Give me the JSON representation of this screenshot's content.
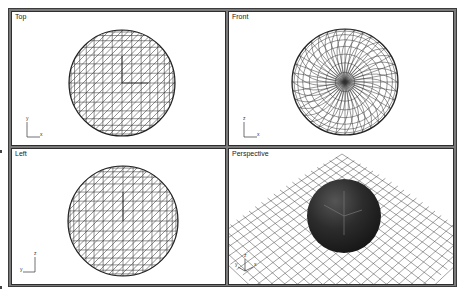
{
  "viewports": [
    {
      "id": "top",
      "label": "Top",
      "axis": {
        "vertical": "y",
        "horizontal": "x"
      }
    },
    {
      "id": "front",
      "label": "Front",
      "axis": {
        "vertical": "z",
        "horizontal": "x"
      }
    },
    {
      "id": "left",
      "label": "Left",
      "axis": {
        "vertical": "z",
        "horizontal": "y"
      }
    },
    {
      "id": "perspective",
      "label": "Perspective",
      "axis": {
        "vertical": "z",
        "left": "y",
        "right": "x"
      }
    }
  ],
  "colors": {
    "frame": "#7a7a7a",
    "border": "#2e2e2e",
    "wire": "#333333",
    "sphere": "#2a2a2a",
    "viewport_bg": "#ffffff"
  }
}
